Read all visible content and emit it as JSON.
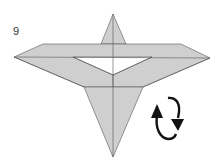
{
  "diagram": {
    "step_number": "9",
    "fill_color": "#cfcfcf",
    "line_color": "#555555",
    "paper_color": "#ffffff",
    "arrow": "turn-over-rotation-icon"
  }
}
